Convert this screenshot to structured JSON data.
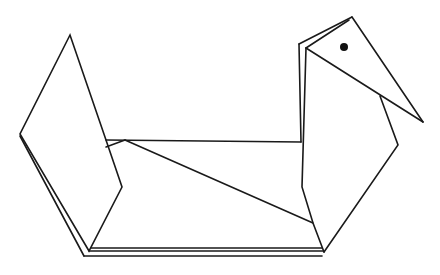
{
  "figure": {
    "stroke_color": "#1a1a1a",
    "background": "#ffffff",
    "eye_color": "#111111",
    "parts": {
      "left_wing": "M70,35 L20,134 L89,251 L122,187 L106,140 Z",
      "left_wing_outer_edge": "M20,136 L84,256",
      "base_top": "M89,251 L323,251",
      "base_bottom": "M84,256 L322,256",
      "base_middle": "M91,248 L322,248",
      "body_top": "M106,140 L301,142",
      "body_fold_small": "M106,147 L125,140",
      "body_diagonal": "M125,140 L313,223",
      "neck_outer": "M299,44 L301,142",
      "neck_outer_link": "M299,44 L352,17",
      "neck_inner": "M306,48 L302,187 L313,223 L324,252",
      "head_top_inner": "M306,48 L349,20",
      "head_back": "M352,17 L423,122",
      "head_lower": "M306,48 L423,122",
      "chest": "M380,96 L398,145 L324,252"
    },
    "eye": {
      "cx": 344,
      "cy": 47,
      "r": 4
    }
  }
}
